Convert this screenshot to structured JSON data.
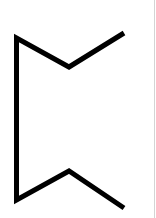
{
  "figure": {
    "background": "#ffffff",
    "stroke_color": "#000000",
    "stroke_width": 5,
    "glyph": {
      "name": "rune-glyph",
      "points": [
        [
          124,
          33
        ],
        [
          69,
          67
        ],
        [
          16.5,
          38
        ],
        [
          16.5,
          200
        ],
        [
          69,
          171
        ],
        [
          124,
          208
        ]
      ]
    },
    "edge_line_color": "#d4d4d4"
  }
}
